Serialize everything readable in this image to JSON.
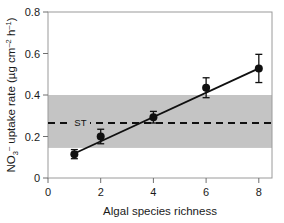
{
  "chart_data": {
    "type": "scatter",
    "title": "",
    "xlabel": "Algal species richness",
    "ylabel": "NO3- uptake rate (ug cm-2 h-1)",
    "ylabel_parts": {
      "base1": "NO",
      "sub1": "3",
      "sup1": "–",
      "mid": " uptake rate (µg cm",
      "sup2": "–2",
      "mid2": " h",
      "sup3": "–1",
      "tail": ")"
    },
    "xlim": [
      0,
      8.5
    ],
    "ylim": [
      0,
      0.8
    ],
    "xticks": [
      0,
      2,
      4,
      6,
      8
    ],
    "xtick_labels": [
      "0",
      "2",
      "4",
      "6",
      "8"
    ],
    "yticks": [
      0,
      0.2,
      0.4,
      0.6,
      0.8
    ],
    "ytick_labels": [
      "0",
      "0.2",
      "0.4",
      "0.6",
      "0.8"
    ],
    "grid": false,
    "legend": "none",
    "x": [
      1,
      2,
      4,
      6,
      8
    ],
    "values": [
      0.115,
      0.2,
      0.293,
      0.435,
      0.528
    ],
    "yerr": [
      0.022,
      0.035,
      0.028,
      0.048,
      0.068
    ],
    "marker": "filled-circle",
    "marker_color": "#101010",
    "fit_line": {
      "type": "linear-regression",
      "x_start": 1,
      "y_start": 0.118,
      "x_end": 8,
      "y_end": 0.528,
      "color": "#101010"
    },
    "reference_line": {
      "label": "ST",
      "y": 0.265,
      "style": "dashed",
      "color": "#101010"
    },
    "shaded_band": {
      "y_low": 0.145,
      "y_high": 0.4,
      "color": "#c4c4c4"
    },
    "frame_color": "#9a9a9a"
  }
}
